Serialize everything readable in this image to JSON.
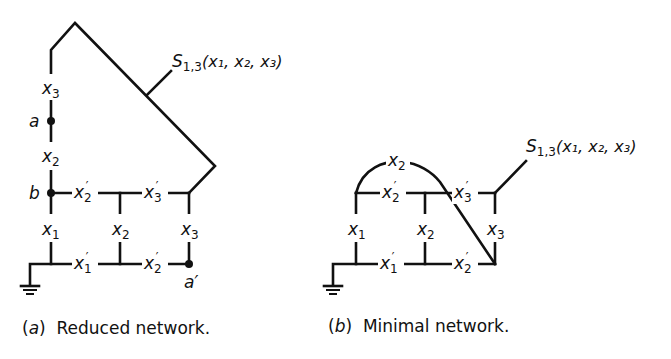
{
  "figure": {
    "left": {
      "caption_letter": "a",
      "caption_text": "Reduced network.",
      "output_label": "S",
      "output_subscript": "1,3",
      "output_args": "(x₁, x₂, x₃)",
      "nodes": {
        "a": "a",
        "b": "b",
        "a_prime": "a′"
      },
      "contacts": {
        "top_left": "x₃",
        "mid_left": "x₂",
        "bottom_left": "x₁",
        "top_rail_1": "x₂′",
        "top_rail_2": "x₃′",
        "middle_vertical": "x₂",
        "right_vertical": "x₃",
        "bottom_rail_1": "x₁′",
        "bottom_rail_2": "x₂′"
      }
    },
    "right": {
      "caption_letter": "b",
      "caption_text": "Minimal network.",
      "output_label": "S",
      "output_subscript": "1,3",
      "output_args": "(x₁, x₂, x₃)",
      "contacts": {
        "arc": "x₂",
        "top_rail_1": "x₂′",
        "top_rail_2": "x₃′",
        "left_vertical": "x₁",
        "middle_vertical": "x₂",
        "right_vertical": "x₃",
        "bottom_rail_1": "x₁′",
        "bottom_rail_2": "x₂′"
      }
    }
  }
}
